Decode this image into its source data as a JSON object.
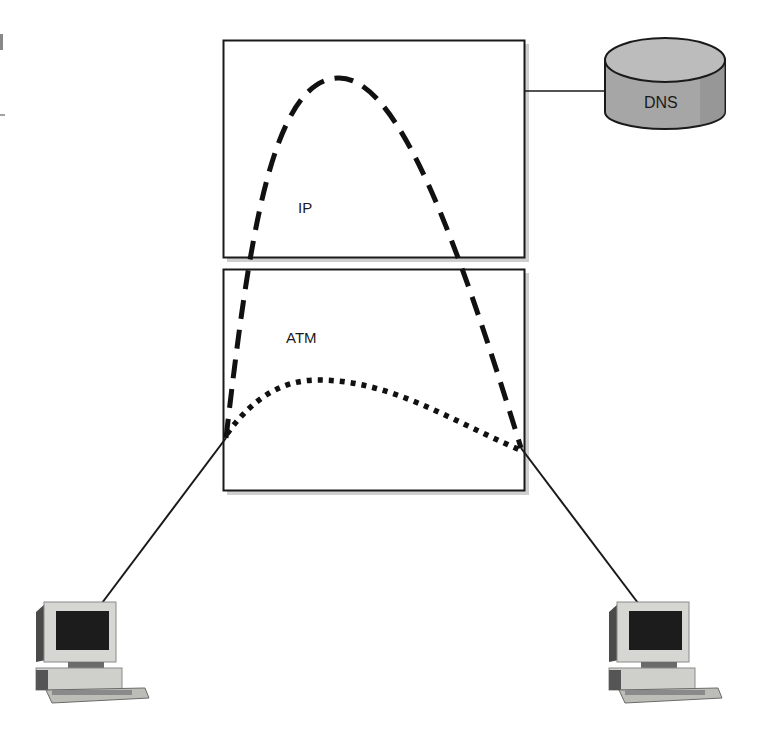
{
  "diagram": {
    "layers": [
      {
        "id": "ip",
        "label": "IP"
      },
      {
        "id": "atm",
        "label": "ATM"
      }
    ],
    "server": {
      "label": "DNS",
      "shape": "cylinder"
    },
    "endpoints": [
      {
        "id": "host-left",
        "type": "computer"
      },
      {
        "id": "host-right",
        "type": "computer"
      }
    ],
    "paths": [
      {
        "id": "ip-path",
        "layer": "IP",
        "style": "dashed"
      },
      {
        "id": "atm-path",
        "layer": "ATM",
        "style": "dotted"
      }
    ],
    "colors": {
      "stroke": "#1a1a1a",
      "box_shadow": "#c8c8c8",
      "cylinder_body": "#a9a9a9",
      "cylinder_top": "#bdbdbd",
      "monitor_bezel": "#d6d6d2",
      "monitor_screen": "#1c1c1c"
    }
  }
}
